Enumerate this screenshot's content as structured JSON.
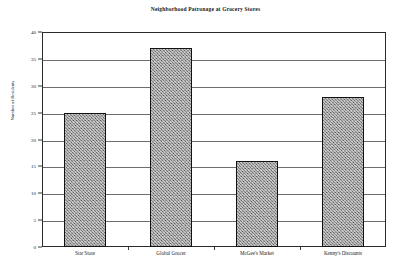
{
  "chart_data": {
    "type": "bar",
    "title": "Neighborhood Patronage at Grocery Stores",
    "xlabel": "",
    "ylabel": "Number of Residents",
    "categories": [
      "Star Store",
      "Global Grocer",
      "McGee's Market",
      "Kenny's Discounts"
    ],
    "values": [
      25,
      37,
      16,
      28
    ],
    "ylim": [
      0,
      40
    ],
    "ytick_step": 5,
    "yticks": [
      0,
      5,
      10,
      15,
      20,
      25,
      30,
      35,
      40
    ],
    "ytick_labels": [
      "0",
      "5",
      "10",
      "15",
      "20",
      "25",
      "30",
      "35",
      "40"
    ],
    "grid": true,
    "grid_axis": "y",
    "legend": false,
    "legend_position": "none",
    "series": [
      {
        "name": "Number of Residents",
        "values": [
          25,
          37,
          16,
          28
        ]
      }
    ],
    "colors": {
      "bar_fill": "#8d8d8d",
      "bar_edge": "#121212",
      "gridline": "#6e6e6e",
      "frame": "#2b2b2b",
      "text": "#1a1a1a",
      "background": "#ffffff"
    }
  }
}
